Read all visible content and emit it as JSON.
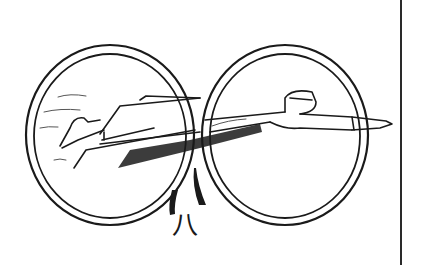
{
  "figure": {
    "caption": "八",
    "colors": {
      "ink": "#1a1a1a",
      "background": "#ffffff",
      "rule": "#2a2a2a"
    }
  }
}
